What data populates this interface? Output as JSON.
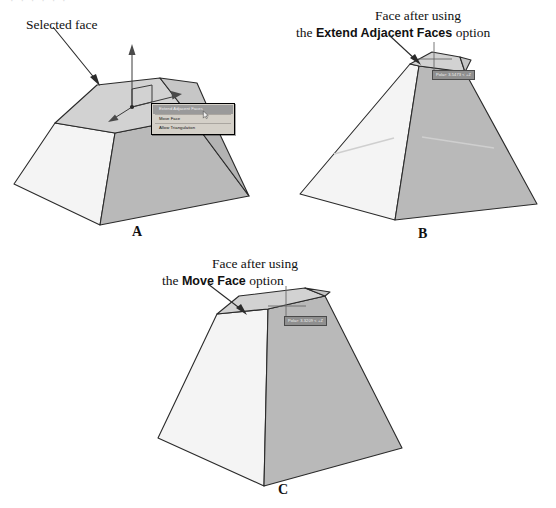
{
  "page": {
    "bleed_text": "·  ·   ·    ·     ·      ·",
    "background_color": "#ffffff",
    "ink_color": "#1a1a1a"
  },
  "palette": {
    "face_top": "#d9d9d9",
    "face_left": "#f4f4f4",
    "face_right": "#b9b9b9",
    "face_top_selected": "#cfcfcf",
    "outline": "#2a2a2a",
    "menu_bg": "#d4d0c8",
    "menu_highlight": "#9a9a9a",
    "tooltip_bg": "#8f8f8f",
    "tooltip_text": "#f4f4f4"
  },
  "figures": [
    {
      "id": "A",
      "label": "A",
      "callout": {
        "text": "Selected face",
        "arrow": "points-down-right-to-top-face"
      },
      "gizmo": {
        "name": "3d-move-gizmo",
        "axes": [
          "z-axis-arrow-up",
          "x-axis-arrow-right",
          "y-axis-arrow-down-left"
        ],
        "plane_handle": "xy-plane-square-handle"
      },
      "context_menu": {
        "name": "face-edit-context-menu",
        "items": [
          {
            "label": "Extend Adjacent Faces",
            "highlighted": true
          },
          {
            "label": "Move Face",
            "highlighted": false
          },
          {
            "label": "Allow Triangulation",
            "highlighted": false
          }
        ]
      }
    },
    {
      "id": "B",
      "label": "B",
      "callout": {
        "line1": "Face after using",
        "line2_prefix": "the ",
        "line2_bold": "Extend Adjacent Faces",
        "line2_suffix": " option",
        "arrow": "points-down-right-to-top-face"
      },
      "tooltip": {
        "name": "polar-coordinate-readout",
        "text": "Polar: 3.5473 < +Z"
      },
      "crosshair": "move-crosshair-cursor"
    },
    {
      "id": "C",
      "label": "C",
      "callout": {
        "line1": "Face after using",
        "line2_prefix": "the ",
        "line2_bold": "Move Face",
        "line2_suffix": " option",
        "arrow": "points-down-right-to-top-face"
      },
      "tooltip": {
        "name": "polar-coordinate-readout",
        "text": "Polar: 3.3209 < +Z"
      },
      "crosshair": "move-crosshair-cursor"
    }
  ]
}
